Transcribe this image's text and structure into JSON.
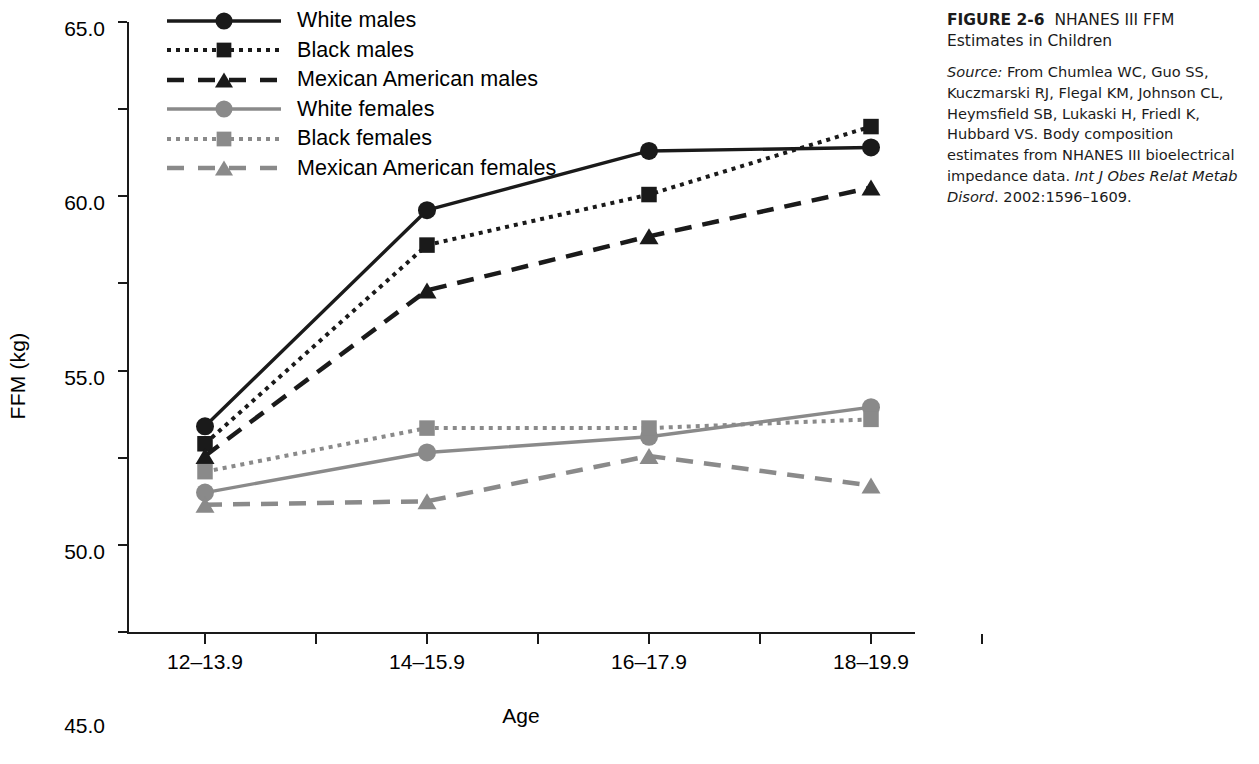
{
  "caption": {
    "figure_number": "FIGURE 2-6",
    "title": "NHANES III FFM Estimates in Children",
    "source_label": "Source:",
    "source_text_1": "From Chumlea WC, Guo SS, Kuczmarski RJ, Flegal KM, Johnson CL, Heymsfield SB, Lukaski H, Friedl K, Hubbard VS. Body composition estimates from NHANES III bioelectrical impedance data.",
    "journal": "Int J Obes Relat Metab Disord",
    "source_text_2": ". 2002:1596–1609."
  },
  "chart_data": {
    "type": "line",
    "title": "",
    "xlabel": "Age",
    "ylabel": "FFM (kg)",
    "categories": [
      "12–13.9",
      "14–15.9",
      "16–17.9",
      "18–19.9"
    ],
    "ylim": [
      30.0,
      65.0
    ],
    "yticks": [
      "65.0",
      "60.0",
      "55.0",
      "50.0",
      "45.0",
      "40.0",
      "35.0",
      "30.0"
    ],
    "ytick_values": [
      65.0,
      60.0,
      55.0,
      50.0,
      45.0,
      40.0,
      35.0,
      30.0
    ],
    "grid": false,
    "legend_position": "top-left-inside",
    "series": [
      {
        "name": "White males",
        "values": [
          41.8,
          54.2,
          57.6,
          57.8
        ],
        "color": "#1a1a1a",
        "marker": "circle",
        "dash": "none"
      },
      {
        "name": "Black males",
        "values": [
          40.8,
          52.2,
          55.1,
          59.0
        ],
        "color": "#1a1a1a",
        "marker": "square",
        "dash": "dotted"
      },
      {
        "name": "Mexican American males",
        "values": [
          40.1,
          49.6,
          52.7,
          55.5
        ],
        "color": "#1a1a1a",
        "marker": "triangle",
        "dash": "dashed"
      },
      {
        "name": "White females",
        "values": [
          38.0,
          40.3,
          41.2,
          42.9
        ],
        "color": "#8a8a8a",
        "marker": "circle",
        "dash": "none"
      },
      {
        "name": "Black females",
        "values": [
          39.2,
          41.7,
          41.7,
          42.2
        ],
        "color": "#8a8a8a",
        "marker": "square",
        "dash": "dotted"
      },
      {
        "name": "Mexican American females",
        "values": [
          37.3,
          37.5,
          40.1,
          38.4
        ],
        "color": "#8a8a8a",
        "marker": "triangle",
        "dash": "dashed"
      }
    ]
  }
}
